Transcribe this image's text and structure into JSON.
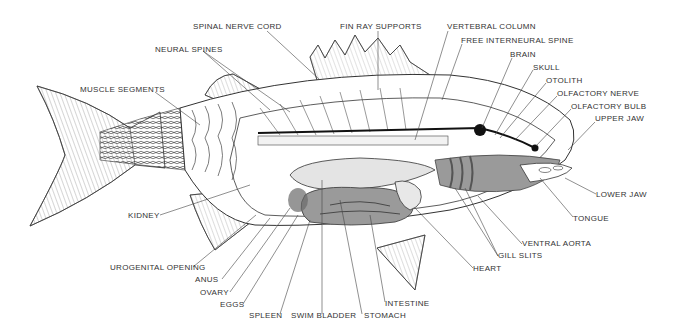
{
  "diagram": {
    "title": "",
    "colors": {
      "ink": "#2a2a2a",
      "organ_fill": "#9a9a9a",
      "organ_dark": "#7a7a7a",
      "bladder_fill": "#e4e4e4",
      "background": "#ffffff"
    },
    "labels": [
      {
        "id": "spinal-nerve-cord",
        "text": "SPINAL NERVE CORD",
        "x": 193,
        "y": 26
      },
      {
        "id": "fin-ray-supports",
        "text": "FIN RAY SUPPORTS",
        "x": 340,
        "y": 26
      },
      {
        "id": "vertebral-column",
        "text": "VERTEBRAL COLUMN",
        "x": 447,
        "y": 26
      },
      {
        "id": "free-interneural-spine",
        "text": "FREE INTERNEURAL SPINE",
        "x": 461,
        "y": 40
      },
      {
        "id": "neural-spines",
        "text": "NEURAL SPINES",
        "x": 155,
        "y": 48
      },
      {
        "id": "brain",
        "text": "BRAIN",
        "x": 510,
        "y": 54
      },
      {
        "id": "skull",
        "text": "SKULL",
        "x": 533,
        "y": 67
      },
      {
        "id": "otolith",
        "text": "OTOLITH",
        "x": 546,
        "y": 80
      },
      {
        "id": "olfactory-nerve",
        "text": "OLFACTORY NERVE",
        "x": 557,
        "y": 93
      },
      {
        "id": "olfactory-bulb",
        "text": "OLFACTORY BULB",
        "x": 571,
        "y": 106
      },
      {
        "id": "upper-jaw",
        "text": "UPPER JAW",
        "x": 595,
        "y": 118
      },
      {
        "id": "muscle-segments",
        "text": "MUSCLE SEGMENTS",
        "x": 80,
        "y": 87
      },
      {
        "id": "lower-jaw",
        "text": "LOWER JAW",
        "x": 596,
        "y": 191
      },
      {
        "id": "kidney",
        "text": "KIDNEY",
        "x": 128,
        "y": 212
      },
      {
        "id": "tongue",
        "text": "TONGUE",
        "x": 573,
        "y": 215
      },
      {
        "id": "ventral-aorta",
        "text": "VENTRAL AORTA",
        "x": 522,
        "y": 241
      },
      {
        "id": "gill-slits",
        "text": "GILL SLITS",
        "x": 498,
        "y": 253
      },
      {
        "id": "urogenital-opening",
        "text": "UROGENITAL OPENING",
        "x": 110,
        "y": 264
      },
      {
        "id": "heart",
        "text": "HEART",
        "x": 473,
        "y": 266
      },
      {
        "id": "anus",
        "text": "ANUS",
        "x": 195,
        "y": 276
      },
      {
        "id": "ovary",
        "text": "OVARY",
        "x": 200,
        "y": 289
      },
      {
        "id": "eggs",
        "text": "EGGS",
        "x": 220,
        "y": 301
      },
      {
        "id": "intestine",
        "text": "INTESTINE",
        "x": 385,
        "y": 300
      },
      {
        "id": "spleen",
        "text": "SPLEEN",
        "x": 249,
        "y": 312
      },
      {
        "id": "swim-bladder",
        "text": "SWIM BLADDER",
        "x": 291,
        "y": 312
      },
      {
        "id": "stomach",
        "text": "STOMACH",
        "x": 364,
        "y": 312
      }
    ]
  }
}
